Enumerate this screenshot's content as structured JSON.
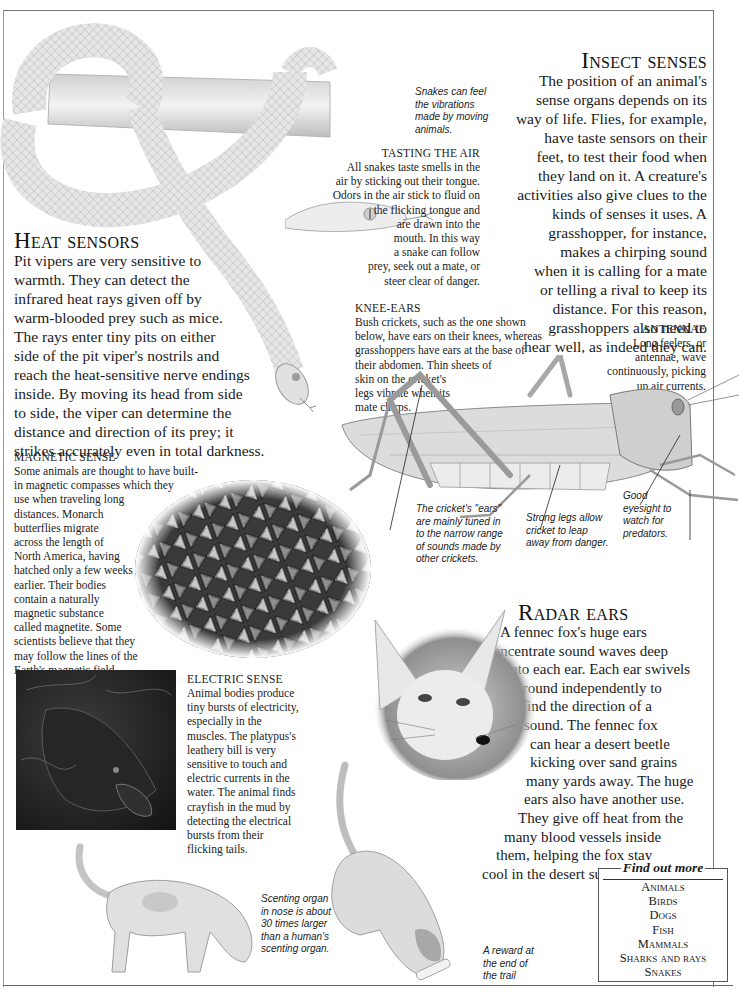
{
  "page": {
    "top_running_head": "· · · · · · · · ·"
  },
  "insect_senses": {
    "heading": "Insect senses",
    "lines": [
      "The position of an animal's",
      "sense organs depends on its",
      "way of life. Flies, for example,",
      "have taste sensors on their",
      "feet, to test their food when",
      "they land on it. A creature's",
      "activities also give clues to the",
      "kinds of senses it uses. A",
      "grasshopper, for instance,",
      "makes a chirping sound",
      "when it is calling for a mate",
      "or telling a rival to keep its",
      "distance. For this reason,",
      "grasshoppers also need to",
      "hear well, as indeed they can."
    ]
  },
  "snake_vibrations_caption": {
    "lines": [
      "Snakes can feel",
      "the vibrations",
      "made by moving",
      "animals."
    ]
  },
  "tasting_the_air": {
    "heading": "TASTING THE AIR",
    "lines": [
      "All snakes taste smells in the",
      "air by sticking out their tongue.",
      "Odors in the air stick to fluid on",
      "the flicking tongue and",
      "are drawn into the",
      "mouth. In this way",
      "a snake can follow",
      "prey, seek out a mate, or",
      "steer clear of danger."
    ]
  },
  "heat_sensors": {
    "heading": "Heat sensors",
    "lines": [
      "Pit vipers are very sensitive to",
      "warmth. They can detect the",
      "infrared heat rays given off by",
      "warm-blooded prey such as mice.",
      "The rays enter tiny pits on either",
      "side of the pit viper's nostrils and",
      "reach the heat-sensitive nerve endings",
      "inside. By moving its head from side",
      "to side, the viper can determine the",
      "distance and direction of its prey; it",
      "strikes accurately even in total darkness."
    ]
  },
  "knee_ears": {
    "heading": "KNEE-EARS",
    "lines": [
      "Bush crickets, such as the one shown",
      "below, have ears on their knees, whereas",
      "grasshoppers have ears at the base of",
      "their abdomen. Thin sheets of",
      "skin on the cricket's",
      "legs vibrate when its",
      "mate chirps."
    ]
  },
  "antennae": {
    "heading": "ANTENNAE",
    "lines": [
      "Long feelers, or",
      "antennae, wave",
      "continuously, picking",
      "up air currents."
    ]
  },
  "cricket_captions": {
    "ears": [
      "The cricket's \"ears\"",
      "are mainly tuned in",
      "to the narrow range",
      "of sounds made by",
      "other crickets."
    ],
    "legs": [
      "Strong legs allow",
      "cricket to leap",
      "away from danger."
    ],
    "eyes": [
      "Good",
      "eyesight to",
      "watch for",
      "predators."
    ]
  },
  "magnetic_sense": {
    "heading": "MAGNETIC SENSE",
    "lines": [
      "Some animals are thought to have built-",
      "in magnetic compasses which they",
      "use when traveling long",
      "distances. Monarch",
      "butterflies migrate",
      "across the length of",
      "North America, having",
      "hatched only a few weeks",
      "earlier. Their bodies",
      "contain a naturally",
      "magnetic substance",
      "called magnetite. Some",
      "scientists believe that they",
      "may follow the lines of the",
      "Earth's magnetic field."
    ]
  },
  "radar_ears": {
    "heading": "Radar ears",
    "lines": [
      "A fennec fox's huge ears",
      "concentrate sound waves deep",
      "into each ear. Each ear swivels",
      "around independently to",
      "find the direction of a",
      "sound. The fennec fox",
      "can hear a desert beetle",
      "kicking over sand grains",
      "many yards away. The huge",
      "ears also have another use.",
      "They give off heat from the",
      "many blood vessels inside",
      "them, helping the fox stay",
      "cool in the desert sun."
    ]
  },
  "electric_sense": {
    "heading": "ELECTRIC SENSE",
    "lines": [
      "Animal bodies produce",
      "tiny bursts of electricity,",
      "especially in the",
      "muscles. The platypus's",
      "leathery bill is very",
      "sensitive to touch and",
      "electric currents in the",
      "water. The animal finds",
      "crayfish in the mud by",
      "detecting the electrical",
      "bursts from their",
      "flicking tails."
    ]
  },
  "dog_captions": {
    "scent": [
      "Scenting organ",
      "in nose is about",
      "30 times larger",
      "than a human's",
      "scenting organ."
    ],
    "reward": [
      "A reward at",
      "the end of",
      "the trail"
    ]
  },
  "find_out_more": {
    "title": "Find out more",
    "items": [
      "Animals",
      "Birds",
      "Dogs",
      "Fish",
      "Mammals",
      "Sharks and rays",
      "Snakes"
    ]
  },
  "colors": {
    "text": "#1a1a1a",
    "frame": "#777777",
    "illustration_gray": "#bdbdbd"
  }
}
